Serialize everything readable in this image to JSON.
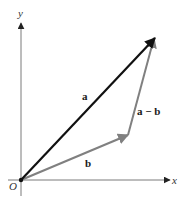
{
  "diagram": {
    "axes": {
      "x_label": "x",
      "y_label": "y",
      "origin_label": "O"
    },
    "vectors": [
      {
        "id": "a",
        "label": "a",
        "from": "O",
        "to": "tip_a",
        "color": "#111111"
      },
      {
        "id": "b",
        "label": "b",
        "from": "O",
        "to": "tip_b",
        "color": "#808080"
      },
      {
        "id": "a_minus_b",
        "label": "a − b",
        "from": "tip_b",
        "to": "tip_a",
        "color": "#808080"
      }
    ],
    "colors": {
      "axis": "#7a7a7a",
      "vector_a": "#111111",
      "vector_b": "#808080",
      "vector_a_minus_b": "#808080",
      "text": "#1a1a1a"
    }
  }
}
